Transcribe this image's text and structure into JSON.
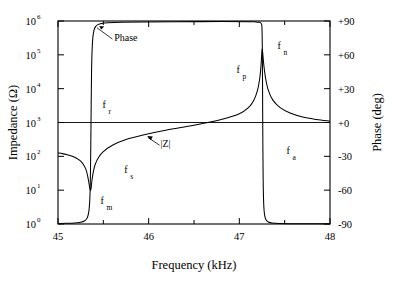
{
  "chart_data": {
    "type": "line",
    "title": "",
    "xlabel": "Frequency (kHz)",
    "ylabel_left": "Impedance (Ω)",
    "ylabel_right": "Phase (deg)",
    "xlim": [
      45,
      48
    ],
    "xticks": [
      45,
      46,
      47,
      48
    ],
    "xticklabels": [
      "45",
      "46",
      "47",
      "48"
    ],
    "xminorticks": [
      45.5,
      46.5,
      47.5
    ],
    "ylim_left_log10": [
      0,
      6
    ],
    "yticks_left": [
      {
        "mantissa": "10",
        "exponent": "0"
      },
      {
        "mantissa": "10",
        "exponent": "1"
      },
      {
        "mantissa": "10",
        "exponent": "2"
      },
      {
        "mantissa": "10",
        "exponent": "3"
      },
      {
        "mantissa": "10",
        "exponent": "4"
      },
      {
        "mantissa": "10",
        "exponent": "5"
      },
      {
        "mantissa": "10",
        "exponent": "6"
      }
    ],
    "ylim_right": [
      -90,
      90
    ],
    "yticks_right": [
      -90,
      -60,
      -30,
      0,
      30,
      60,
      90
    ],
    "yticklabels_right": [
      "-90",
      "-60",
      "-30",
      "+0",
      "+30",
      "+60",
      "+90"
    ],
    "grid": false,
    "legend": "none",
    "series": [
      {
        "name": "|Z|",
        "axis": "left",
        "units": "ohm",
        "points": [
          [
            45.0,
            2.1
          ],
          [
            45.05,
            2.08
          ],
          [
            45.1,
            2.05
          ],
          [
            45.15,
            2.01
          ],
          [
            45.2,
            1.95
          ],
          [
            45.25,
            1.86
          ],
          [
            45.28,
            1.76
          ],
          [
            45.31,
            1.6
          ],
          [
            45.33,
            1.38
          ],
          [
            45.345,
            1.15
          ],
          [
            45.355,
            1.02
          ],
          [
            45.36,
            1.0
          ],
          [
            45.365,
            1.05
          ],
          [
            45.375,
            1.3
          ],
          [
            45.39,
            1.55
          ],
          [
            45.41,
            1.76
          ],
          [
            45.45,
            1.98
          ],
          [
            45.5,
            2.14
          ],
          [
            45.6,
            2.33
          ],
          [
            45.75,
            2.5
          ],
          [
            45.95,
            2.64
          ],
          [
            46.2,
            2.78
          ],
          [
            46.5,
            2.92
          ],
          [
            46.8,
            3.09
          ],
          [
            47.0,
            3.26
          ],
          [
            47.1,
            3.44
          ],
          [
            47.16,
            3.66
          ],
          [
            47.2,
            3.95
          ],
          [
            47.225,
            4.3
          ],
          [
            47.24,
            4.72
          ],
          [
            47.248,
            5.05
          ],
          [
            47.252,
            5.18
          ],
          [
            47.258,
            5.05
          ],
          [
            47.27,
            4.7
          ],
          [
            47.29,
            4.3
          ],
          [
            47.32,
            3.95
          ],
          [
            47.37,
            3.66
          ],
          [
            47.45,
            3.44
          ],
          [
            47.56,
            3.28
          ],
          [
            47.7,
            3.16
          ],
          [
            47.85,
            3.09
          ],
          [
            48.0,
            3.04
          ]
        ]
      },
      {
        "name": "Phase",
        "axis": "right",
        "units": "deg",
        "points": [
          [
            45.0,
            -89.6
          ],
          [
            45.1,
            -89.4
          ],
          [
            45.18,
            -89.1
          ],
          [
            45.25,
            -88.4
          ],
          [
            45.29,
            -87.4
          ],
          [
            45.32,
            -85.0
          ],
          [
            45.34,
            -79.0
          ],
          [
            45.352,
            -66.0
          ],
          [
            45.358,
            -45.0
          ],
          [
            45.362,
            -18.0
          ],
          [
            45.366,
            16.0
          ],
          [
            45.37,
            45.0
          ],
          [
            45.376,
            64.0
          ],
          [
            45.384,
            75.0
          ],
          [
            45.396,
            81.5
          ],
          [
            45.414,
            85.0
          ],
          [
            45.44,
            86.8
          ],
          [
            45.48,
            87.8
          ],
          [
            45.55,
            88.4
          ],
          [
            45.7,
            88.9
          ],
          [
            45.95,
            89.2
          ],
          [
            46.3,
            89.4
          ],
          [
            46.8,
            89.5
          ],
          [
            47.1,
            89.4
          ],
          [
            47.18,
            89.2
          ],
          [
            47.22,
            88.8
          ],
          [
            47.24,
            88.0
          ],
          [
            47.248,
            86.0
          ],
          [
            47.251,
            80.0
          ],
          [
            47.2535,
            66.0
          ],
          [
            47.2555,
            40.0
          ],
          [
            47.2575,
            8.0
          ],
          [
            47.26,
            -26.0
          ],
          [
            47.263,
            -52.0
          ],
          [
            47.267,
            -68.0
          ],
          [
            47.273,
            -78.0
          ],
          [
            47.282,
            -83.5
          ],
          [
            47.296,
            -86.5
          ],
          [
            47.32,
            -88.2
          ],
          [
            47.36,
            -89.1
          ],
          [
            47.44,
            -89.5
          ],
          [
            47.6,
            -89.7
          ],
          [
            47.8,
            -89.8
          ],
          [
            48.0,
            -89.9
          ]
        ]
      }
    ],
    "annotations": [
      {
        "id": "phase-label",
        "text": "Phase",
        "sub": "",
        "x": 45.62,
        "y_axis": "right",
        "y": 72
      },
      {
        "id": "z-label",
        "text": "|Z|",
        "sub": "",
        "x": 46.13,
        "y_axis": "left",
        "y": 2.28
      },
      {
        "id": "fr-label",
        "text": "f",
        "sub": "r",
        "x": 45.49,
        "y_axis": "left",
        "y": 3.42
      },
      {
        "id": "fs-label",
        "text": "f",
        "sub": "s",
        "x": 45.73,
        "y_axis": "left",
        "y": 1.52
      },
      {
        "id": "fm-label",
        "text": "f",
        "sub": "m",
        "x": 45.47,
        "y_axis": "left",
        "y": 0.58
      },
      {
        "id": "fp-label",
        "text": "f",
        "sub": "p",
        "x": 46.97,
        "y_axis": "left",
        "y": 4.46
      },
      {
        "id": "fn-label",
        "text": "f",
        "sub": "n",
        "x": 47.42,
        "y_axis": "left",
        "y": 5.18
      },
      {
        "id": "fa-label",
        "text": "f",
        "sub": "a",
        "x": 47.52,
        "y_axis": "left",
        "y": 2.06
      }
    ]
  }
}
